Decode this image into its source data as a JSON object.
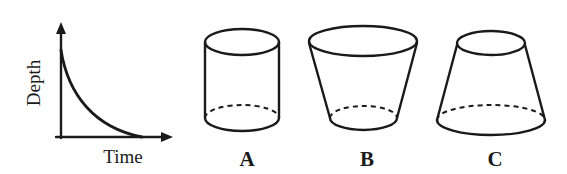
{
  "graph": {
    "ylabel": "Depth",
    "xlabel": "Time",
    "curve": "exponential decay of depth over time"
  },
  "containers": [
    {
      "label": "A",
      "shape": "cylinder"
    },
    {
      "label": "B",
      "shape": "frustum wide top, narrow bottom"
    },
    {
      "label": "C",
      "shape": "frustum narrow top, wide bottom"
    }
  ],
  "colors": {
    "ink": "#1a1a1a",
    "background": "#ffffff"
  }
}
